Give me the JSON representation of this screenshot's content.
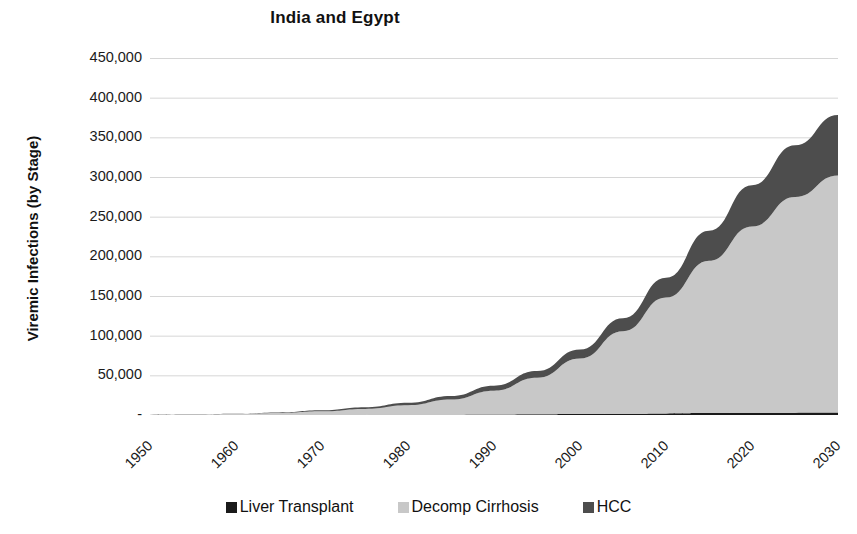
{
  "chart_data": {
    "type": "area",
    "stacked": true,
    "title": "India and Egypt",
    "xlabel": "",
    "ylabel": "Viremic Infections (by Stage)",
    "xlim": [
      1950,
      2030
    ],
    "ylim": [
      0,
      450000
    ],
    "grid": true,
    "legend_position": "bottom",
    "y_tick_labels": [
      "450,000",
      "400,000",
      "350,000",
      "300,000",
      "250,000",
      "200,000",
      "150,000",
      "100,000",
      "50,000",
      "-"
    ],
    "y_tick_values": [
      450000,
      400000,
      350000,
      300000,
      250000,
      200000,
      150000,
      100000,
      50000,
      0
    ],
    "x_tick_labels": [
      "1950",
      "1960",
      "1970",
      "1980",
      "1990",
      "2000",
      "2010",
      "2020",
      "2030"
    ],
    "x_tick_values": [
      1950,
      1960,
      1970,
      1980,
      1990,
      2000,
      2010,
      2020,
      2030
    ],
    "x": [
      1950,
      1955,
      1960,
      1965,
      1970,
      1975,
      1980,
      1985,
      1990,
      1995,
      2000,
      2005,
      2010,
      2015,
      2020,
      2025,
      2030
    ],
    "series": [
      {
        "name": "Liver Transplant",
        "color": "#1a1a1a",
        "values": [
          0,
          0,
          0,
          0,
          100,
          150,
          250,
          400,
          600,
          900,
          1200,
          1600,
          2000,
          2400,
          2700,
          2900,
          3000
        ]
      },
      {
        "name": "Decomp Cirrhosis",
        "color": "#c8c8c8",
        "values": [
          300,
          600,
          1200,
          2500,
          4500,
          7500,
          12000,
          19000,
          30000,
          46000,
          70000,
          104000,
          146000,
          192000,
          235000,
          272000,
          299000
        ]
      },
      {
        "name": "HCC",
        "color": "#4d4d4d",
        "values": [
          100,
          200,
          400,
          800,
          1400,
          2200,
          3200,
          4600,
          6400,
          8600,
          11500,
          16500,
          25000,
          38000,
          52000,
          65000,
          76000
        ]
      }
    ],
    "colors": {
      "liver_transplant": "#1a1a1a",
      "decomp_cirrhosis": "#c8c8c8",
      "hcc": "#4d4d4d",
      "gridline": "#d6d6d6",
      "axis": "#7a7a7a",
      "text": "#111111",
      "background": "#ffffff"
    }
  },
  "legend": {
    "items": [
      {
        "label": "Liver Transplant",
        "color": "#1a1a1a"
      },
      {
        "label": "Decomp Cirrhosis",
        "color": "#c8c8c8"
      },
      {
        "label": "HCC",
        "color": "#4d4d4d"
      }
    ]
  }
}
